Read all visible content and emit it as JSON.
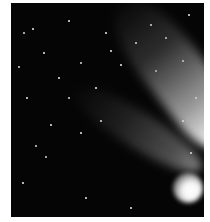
{
  "image": {
    "subject": "comet with bright nucleus and diffuse tail against a starfield",
    "background_color": "#ffffff",
    "sky_color": "#050505",
    "comet_head_color": "#ffffff",
    "tail_color": "#c8c8c8"
  },
  "stars": [
    {
      "x": 13,
      "y": 30,
      "r": 1.2
    },
    {
      "x": 22,
      "y": 26,
      "r": 0.8
    },
    {
      "x": 58,
      "y": 18,
      "r": 0.8
    },
    {
      "x": 95,
      "y": 30,
      "r": 0.8
    },
    {
      "x": 140,
      "y": 22,
      "r": 0.8
    },
    {
      "x": 178,
      "y": 12,
      "r": 0.8
    },
    {
      "x": 8,
      "y": 64,
      "r": 1.0
    },
    {
      "x": 33,
      "y": 50,
      "r": 0.8
    },
    {
      "x": 70,
      "y": 60,
      "r": 1.0
    },
    {
      "x": 100,
      "y": 48,
      "r": 0.8
    },
    {
      "x": 145,
      "y": 68,
      "r": 1.2
    },
    {
      "x": 172,
      "y": 58,
      "r": 0.8
    },
    {
      "x": 58,
      "y": 95,
      "r": 1.4
    },
    {
      "x": 16,
      "y": 95,
      "r": 0.8
    },
    {
      "x": 40,
      "y": 122,
      "r": 0.8
    },
    {
      "x": 25,
      "y": 143,
      "r": 1.0
    },
    {
      "x": 35,
      "y": 154,
      "r": 1.2
    },
    {
      "x": 70,
      "y": 130,
      "r": 0.8
    },
    {
      "x": 90,
      "y": 118,
      "r": 0.8
    },
    {
      "x": 172,
      "y": 118,
      "r": 0.8
    },
    {
      "x": 185,
      "y": 95,
      "r": 0.8
    },
    {
      "x": 12,
      "y": 180,
      "r": 0.8
    },
    {
      "x": 75,
      "y": 195,
      "r": 0.8
    },
    {
      "x": 120,
      "y": 205,
      "r": 0.8
    },
    {
      "x": 180,
      "y": 150,
      "r": 0.8
    },
    {
      "x": 110,
      "y": 62,
      "r": 0.8
    },
    {
      "x": 125,
      "y": 40,
      "r": 0.8
    },
    {
      "x": 155,
      "y": 35,
      "r": 0.8
    },
    {
      "x": 48,
      "y": 75,
      "r": 0.8
    },
    {
      "x": 85,
      "y": 85,
      "r": 0.8
    }
  ]
}
